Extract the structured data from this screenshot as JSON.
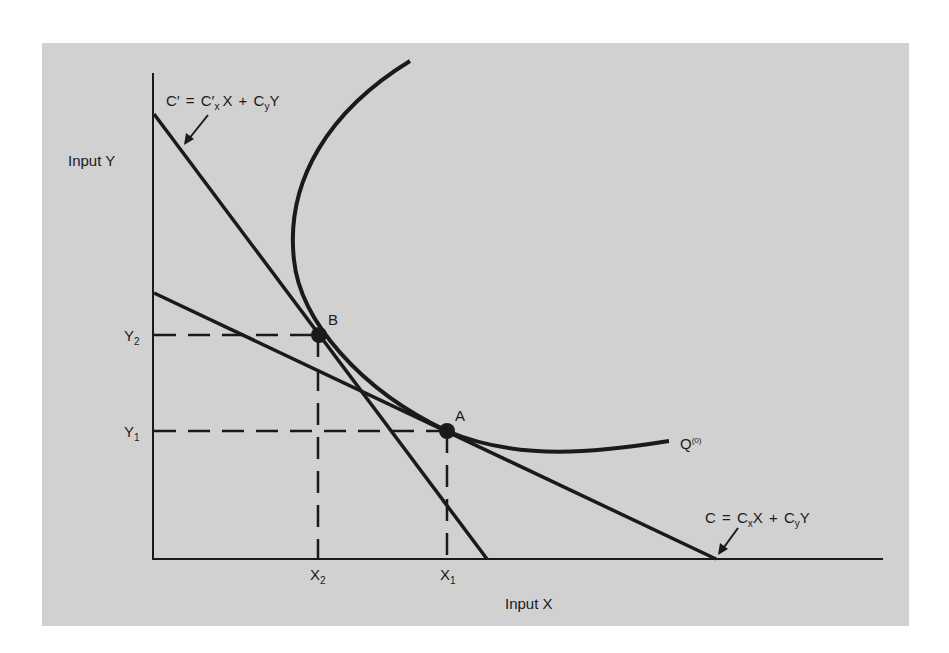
{
  "figure": {
    "background_color": "#d1d1d1",
    "ink_color": "#1a1a1a",
    "axes": {
      "x_label": "Input X",
      "y_label": "Input Y"
    },
    "ticks": {
      "x": [
        {
          "main": "X",
          "sub": "2"
        },
        {
          "main": "X",
          "sub": "1"
        }
      ],
      "y": [
        {
          "main": "Y",
          "sub": "2"
        },
        {
          "main": "Y",
          "sub": "1"
        }
      ]
    },
    "points": [
      {
        "label": "B"
      },
      {
        "label": "A"
      }
    ],
    "isoquant": {
      "main": "Q",
      "sup": "(0)"
    },
    "cost_lines": {
      "new": {
        "lhs": "C′",
        "eq": "=",
        "t1": "C′",
        "t1_sub": "x",
        "t1_var": "X",
        "plus": "+",
        "t2": "C",
        "t2_sub": "y",
        "t2_var": "Y"
      },
      "original": {
        "lhs": "C",
        "eq": "=",
        "t1": "C",
        "t1_sub": "x",
        "t1_var": "X",
        "plus": "+",
        "t2": "C",
        "t2_sub": "y",
        "t2_var": "Y"
      }
    }
  }
}
